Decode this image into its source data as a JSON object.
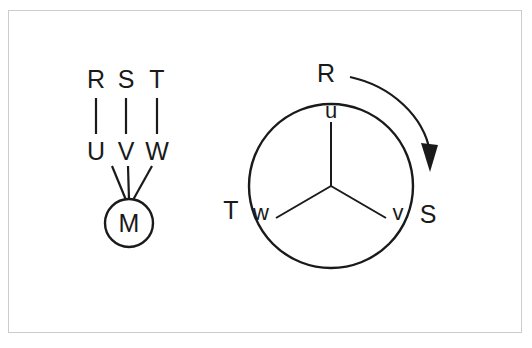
{
  "figure": {
    "background_color": "#ffffff",
    "frame_color": "#cccccc",
    "ink_color": "#1a1a1a",
    "left_diagram": {
      "name": "motor-terminal-box-diagram",
      "terminal_labels_top": [
        "R",
        "S",
        "T"
      ],
      "terminal_labels_bottom": [
        "U",
        "V",
        "W"
      ],
      "machine_label": "M",
      "lead_count": 3
    },
    "right_diagram": {
      "name": "phasor-rotation-diagram",
      "outer_labels": [
        "R",
        "T",
        "S"
      ],
      "inner_labels": [
        "u",
        "w",
        "v"
      ],
      "rotation_arrow": "clockwise-arrow",
      "arrow_direction": "clockwise"
    }
  }
}
